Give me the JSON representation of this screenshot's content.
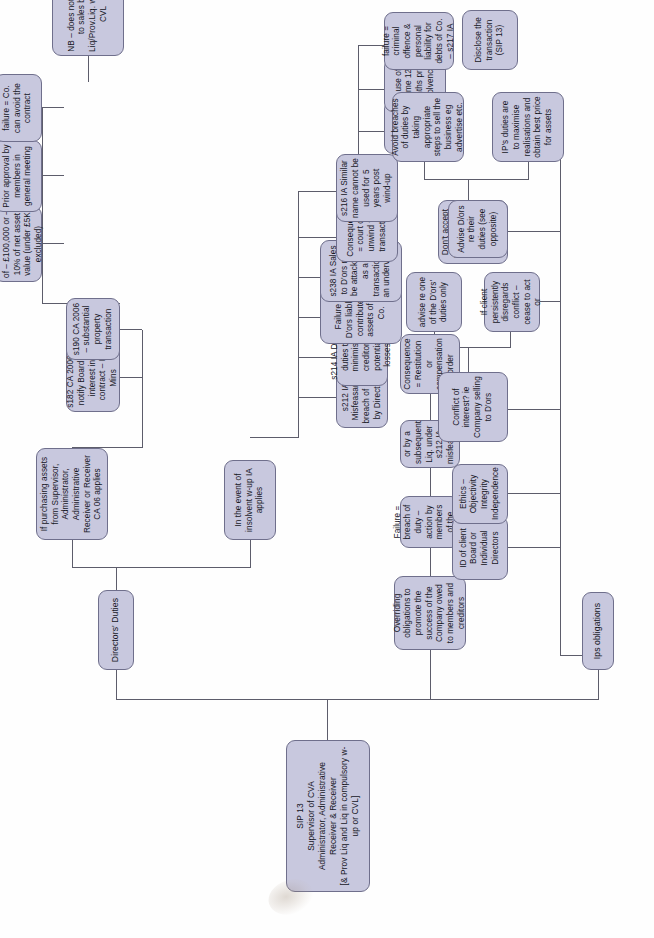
{
  "diagram": {
    "orientation": "rotated-90-ccw",
    "node_fill": "#c8c8de",
    "node_border": "#6f6f8c",
    "connector_color": "#5d5d6b",
    "page_background": "#ffffff"
  },
  "root": {
    "line1": "SIP 13",
    "line2": "Supervisor of CVA",
    "line3": "Administrator, Administrative Receiver & Receiver",
    "line4": "[& Prov Liq and Liq in compulsory w-up or CVL]"
  },
  "branches": {
    "directors_duties_label": "Directors' Duties",
    "ips_obligations_label": "Ips obligations"
  },
  "dd_purchasing": {
    "head": "If purchasing assets from Supervisor, Administrator, Administrative Receiver or Receiver CA 06 applies",
    "s182": "s182 CA 2006 – notify Board re interest in contract – B Mins",
    "s190": "s190 CA 2006 – substantial property transaction",
    "s190_children": [
      "= exceeding lower of – £100,000 or – 10% of net asset value (under £5K excluded)",
      "Prior approval by members in general meeting",
      "failure = Co. can avoid the contract"
    ],
    "nb": "NB – does not apply to sales by Liq/Prov.Liq. w-up of CVL"
  },
  "dd_insolvent": {
    "head": "In the event of insolvent w-up IA applies",
    "children": [
      "s212 IA Misfeasance breach of duty by Directors",
      "s214 IA D'ors duties to minimise creditors potential losses",
      "Failure = D'ors liable to contribute to assets of the Co.",
      "s238 IA Sales to D'ors may be attackable as a transaction at an undervalue",
      "Consequence = court can unwind the transaction",
      "s216 IA Similar name cannot be used for 5 years post  wind-up"
    ],
    "s216_children": [
      "unless sale is made by IP",
      "or use of name 12 months pre-insolvency",
      "failure = criminal offence & personal liability for debts of Co. – s217 IA"
    ]
  },
  "overriding": {
    "head": "Overriding obligations to promote the success of the Company owed to members and creditors",
    "failure": "Failure = breach of duty – action by members of the company",
    "subsequent": "or by a subsequent Liq. under s212 IA misfeasance",
    "consequence": "Consequence = Restitution or compensation order"
  },
  "ips": {
    "id_of_client": "ID of client Board or Individual Directors",
    "ethics": "Ethics – Objectivity Integrity Independence",
    "conflict": "Conflict of interest? ie Company selling to D'ors",
    "conflict_children": [
      "advise re one of the D'ors' duties only",
      "If client persistently disregards conflict – cease to act or"
    ],
    "dont_accept": "Don't accept appointment if that would undermine public confidence",
    "advise_dors": "Advise D/ors re their duties (see opposite)",
    "advise_children": [
      "Avoid breaches of duties by taking appropriate steps to sell the business eg advertise etc.",
      "IP's duties are to maximise realisations and obtain best price for assets"
    ],
    "disclose": "Disclose the transaction (SIP 13)"
  }
}
